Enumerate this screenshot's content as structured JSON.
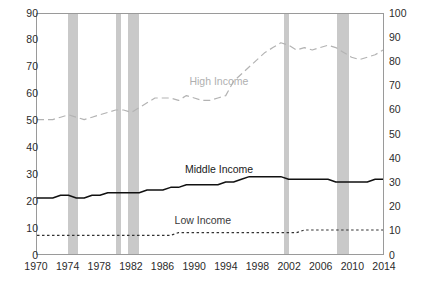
{
  "chart_data": {
    "type": "line",
    "title": "",
    "subtitle": "",
    "xlabel": "",
    "ylabel": "",
    "ylabel_right": "",
    "x": [
      1970,
      1971,
      1972,
      1973,
      1974,
      1975,
      1976,
      1977,
      1978,
      1979,
      1980,
      1981,
      1982,
      1983,
      1984,
      1985,
      1986,
      1987,
      1988,
      1989,
      1990,
      1991,
      1992,
      1993,
      1994,
      1995,
      1996,
      1997,
      1998,
      1999,
      2000,
      2001,
      2002,
      2003,
      2004,
      2005,
      2006,
      2007,
      2008,
      2009,
      2010,
      2011,
      2012,
      2013,
      2014
    ],
    "xlim": [
      1970,
      2014
    ],
    "xticks": [
      1970,
      1974,
      1978,
      1982,
      1986,
      1990,
      1994,
      1998,
      2002,
      2006,
      2010,
      2014
    ],
    "ylim_left": [
      0,
      90
    ],
    "yticks_left": [
      0,
      10,
      20,
      30,
      40,
      50,
      60,
      70,
      80,
      90
    ],
    "ylim_right": [
      0,
      100
    ],
    "yticks_right": [
      0,
      10,
      20,
      30,
      40,
      50,
      60,
      70,
      80,
      90,
      100
    ],
    "grid": false,
    "legend_position": "inline-annotations",
    "series": [
      {
        "name": "High Income",
        "axis": "right",
        "color": "#b3b3b3",
        "style": "dashed",
        "values": [
          56,
          56,
          56,
          57,
          58,
          57,
          56,
          57,
          58,
          59,
          60,
          60,
          59,
          61,
          63,
          65,
          65,
          65,
          64,
          66,
          65,
          64,
          64,
          65,
          66,
          72,
          75,
          78,
          81,
          84,
          86,
          88,
          87,
          85,
          86,
          85,
          86,
          87,
          86,
          84,
          82,
          81,
          82,
          83,
          85
        ]
      },
      {
        "name": "Middle Income",
        "axis": "left",
        "color": "#111111",
        "style": "solid",
        "values": [
          21,
          21,
          21,
          22,
          22,
          21,
          21,
          22,
          22,
          23,
          23,
          23,
          23,
          23,
          24,
          24,
          24,
          25,
          25,
          26,
          26,
          26,
          26,
          26,
          27,
          27,
          28,
          29,
          29,
          29,
          29,
          29,
          28,
          28,
          28,
          28,
          28,
          28,
          27,
          27,
          27,
          27,
          27,
          28,
          28
        ]
      },
      {
        "name": "Low Income",
        "axis": "left",
        "color": "#333333",
        "style": "dotted",
        "values": [
          7,
          7,
          7,
          7,
          7,
          7,
          7,
          7,
          7,
          7,
          7,
          7,
          7,
          7,
          7,
          7,
          7,
          7,
          8,
          8,
          8,
          8,
          8,
          8,
          8,
          8,
          8,
          8,
          8,
          8,
          8,
          8,
          8,
          8,
          9,
          9,
          9,
          9,
          9,
          9,
          9,
          9,
          9,
          9,
          9
        ]
      }
    ],
    "recession_bands": [
      {
        "start": 1973.9,
        "end": 1975.2
      },
      {
        "start": 1980.0,
        "end": 1980.6
      },
      {
        "start": 1981.5,
        "end": 1982.9
      },
      {
        "start": 2001.2,
        "end": 2001.9
      },
      {
        "start": 2007.9,
        "end": 2009.5
      }
    ],
    "annotations": [
      {
        "label": "High Income",
        "x": 1993,
        "y": 72,
        "axis": "right"
      },
      {
        "label": "Middle Income",
        "x": 1993,
        "y": 32,
        "axis": "left"
      },
      {
        "label": "Low Income",
        "x": 1991,
        "y": 13,
        "axis": "left"
      }
    ],
    "colors": {
      "recession_band": "#c9c9c9",
      "frame": "#9a9a9a",
      "text": "#2b2b2b",
      "background": "#ffffff"
    }
  }
}
